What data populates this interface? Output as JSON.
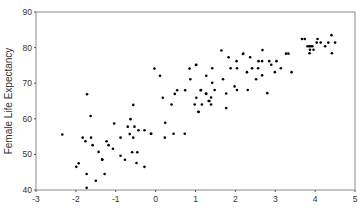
{
  "chart_data": {
    "type": "scatter",
    "title": "",
    "xlabel": "",
    "ylabel": "Female Life Expectancy",
    "xlim": [
      -3,
      5
    ],
    "ylim": [
      40,
      90
    ],
    "x_ticks": [
      -3,
      -2,
      -1,
      0,
      1,
      2,
      3,
      4,
      5
    ],
    "y_ticks": [
      40,
      50,
      60,
      70,
      80,
      90
    ],
    "grid": false,
    "legend": null,
    "marker_color": "#000000",
    "series": [
      {
        "name": "points",
        "points": [
          [
            -2.34,
            55.6
          ],
          [
            -1.99,
            46.5
          ],
          [
            -1.93,
            47.5
          ],
          [
            -1.83,
            54.7
          ],
          [
            -1.76,
            53.7
          ],
          [
            -1.72,
            66.9
          ],
          [
            -1.63,
            60.8
          ],
          [
            -1.62,
            54.7
          ],
          [
            -1.58,
            52.6
          ],
          [
            -1.73,
            44.5
          ],
          [
            -1.73,
            40.6
          ],
          [
            -1.5,
            42.6
          ],
          [
            -1.43,
            50.7
          ],
          [
            -1.34,
            48.6
          ],
          [
            -1.28,
            44.5
          ],
          [
            -1.23,
            53.7
          ],
          [
            -1.18,
            52.6
          ],
          [
            -1.34,
            48.5
          ],
          [
            -1.07,
            51.6
          ],
          [
            -1.04,
            58.7
          ],
          [
            -0.88,
            54.7
          ],
          [
            -0.88,
            49.6
          ],
          [
            -0.77,
            48.5
          ],
          [
            -0.7,
            57.8
          ],
          [
            -0.65,
            55.7
          ],
          [
            -0.63,
            59.9
          ],
          [
            -0.56,
            63.9
          ],
          [
            -0.56,
            54.7
          ],
          [
            -0.53,
            57.8
          ],
          [
            -0.59,
            50.6
          ],
          [
            -0.46,
            50.6
          ],
          [
            -0.48,
            47.6
          ],
          [
            -0.43,
            56.8
          ],
          [
            -0.28,
            56.8
          ],
          [
            -0.28,
            46.5
          ],
          [
            -0.12,
            55.8
          ],
          [
            -0.03,
            74.1
          ],
          [
            0.11,
            72.1
          ],
          [
            -0.11,
            55.8
          ],
          [
            0.18,
            65.9
          ],
          [
            0.23,
            54.7
          ],
          [
            0.24,
            58.9
          ],
          [
            0.4,
            64.0
          ],
          [
            0.45,
            55.8
          ],
          [
            0.48,
            67.0
          ],
          [
            0.54,
            68.0
          ],
          [
            0.73,
            55.8
          ],
          [
            0.74,
            68.0
          ],
          [
            0.85,
            74.1
          ],
          [
            0.87,
            71.1
          ],
          [
            1.01,
            75.1
          ],
          [
            0.98,
            64.0
          ],
          [
            1.02,
            65.9
          ],
          [
            1.08,
            61.9
          ],
          [
            1.13,
            68.0
          ],
          [
            1.16,
            64.0
          ],
          [
            1.27,
            72.1
          ],
          [
            1.27,
            67.0
          ],
          [
            1.33,
            65.0
          ],
          [
            1.02,
            75.2
          ],
          [
            1.42,
            74.2
          ],
          [
            1.69,
            71.1
          ],
          [
            1.42,
            70.1
          ],
          [
            1.14,
            68.1
          ],
          [
            1.48,
            68.1
          ],
          [
            1.26,
            67.1
          ],
          [
            1.39,
            66.0
          ],
          [
            1.35,
            65.0
          ],
          [
            1.39,
            64.0
          ],
          [
            1.07,
            62.0
          ],
          [
            1.65,
            79.2
          ],
          [
            1.83,
            77.3
          ],
          [
            1.77,
            67.1
          ],
          [
            1.77,
            63.0
          ],
          [
            1.88,
            74.2
          ],
          [
            1.98,
            69.1
          ],
          [
            2.03,
            76.2
          ],
          [
            2.04,
            74.2
          ],
          [
            2.04,
            68.1
          ],
          [
            2.19,
            78.2
          ],
          [
            2.29,
            73.1
          ],
          [
            2.31,
            68.1
          ],
          [
            2.2,
            78.3
          ],
          [
            2.37,
            77.3
          ],
          [
            2.42,
            74.2
          ],
          [
            2.52,
            71.1
          ],
          [
            2.57,
            74.2
          ],
          [
            2.58,
            76.2
          ],
          [
            2.67,
            76.2
          ],
          [
            2.67,
            72.2
          ],
          [
            2.68,
            79.3
          ],
          [
            2.8,
            67.2
          ],
          [
            2.85,
            76.2
          ],
          [
            2.9,
            75.2
          ],
          [
            2.99,
            73.1
          ],
          [
            3.03,
            76.2
          ],
          [
            3.14,
            74.2
          ],
          [
            3.27,
            78.3
          ],
          [
            3.33,
            78.3
          ],
          [
            3.41,
            73.1
          ],
          [
            3.67,
            82.4
          ],
          [
            3.74,
            82.4
          ],
          [
            3.81,
            80.4
          ],
          [
            3.85,
            80.4
          ],
          [
            3.89,
            80.4
          ],
          [
            3.93,
            80.4
          ],
          [
            3.87,
            79.4
          ],
          [
            3.96,
            79.4
          ],
          [
            3.86,
            78.4
          ],
          [
            4.04,
            81.4
          ],
          [
            4.06,
            82.4
          ],
          [
            4.14,
            81.4
          ],
          [
            4.25,
            80.4
          ],
          [
            4.33,
            81.4
          ],
          [
            4.41,
            83.5
          ],
          [
            4.42,
            78.4
          ],
          [
            4.5,
            81.4
          ]
        ]
      }
    ]
  }
}
